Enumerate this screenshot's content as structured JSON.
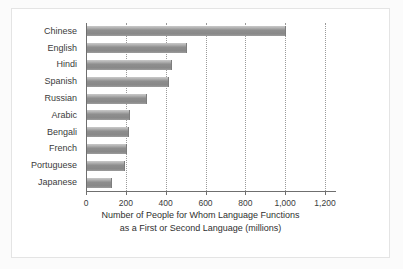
{
  "chart_data": {
    "type": "bar",
    "orientation": "horizontal",
    "title": "",
    "xlabel": "Number of People for Whom Language Functions as a First or Second Language (millions)",
    "xlabel_line1": "Number of People for Whom Language Functions",
    "xlabel_line2": "as a First or Second Language (millions)",
    "ylabel": "",
    "categories": [
      "Chinese",
      "English",
      "Hindi",
      "Spanish",
      "Russian",
      "Arabic",
      "Bengali",
      "French",
      "Portuguese",
      "Japanese"
    ],
    "values": [
      1000,
      500,
      425,
      410,
      300,
      215,
      210,
      200,
      190,
      125
    ],
    "xlim": [
      0,
      1200
    ],
    "xticks": [
      0,
      200,
      400,
      600,
      800,
      1000,
      1200
    ],
    "xticklabels": [
      "0",
      "200",
      "400",
      "600",
      "800",
      "1,000",
      "1,200"
    ],
    "grid": "vertical-dotted",
    "legend": "none",
    "bar_color": "#8e8e8e",
    "bar_edge_color": "#7d7d7d",
    "gridline_color": "#9a9a9a",
    "axis_color": "#6f6f6f",
    "background_color": "#ffffff",
    "frame_color": "#e4e4e4"
  }
}
